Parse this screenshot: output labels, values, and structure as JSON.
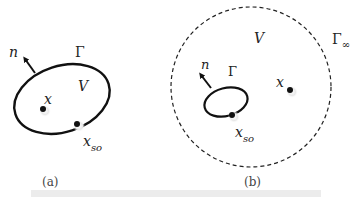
{
  "figure": {
    "panels": [
      {
        "id": "a",
        "caption": "(a)",
        "boundary_label": "Γ",
        "volume_label": "V",
        "normal_label": "n",
        "interior_point_label": "x",
        "source_point_label": "x",
        "source_point_subscript": "so"
      },
      {
        "id": "b",
        "caption": "(b)",
        "boundary_label": "Γ",
        "volume_label": "V",
        "normal_label": "n",
        "exterior_point_label": "x",
        "source_point_label": "x",
        "source_point_subscript": "so",
        "infinity_boundary_label": "Γ",
        "infinity_boundary_subscript": "∞"
      }
    ],
    "colors": {
      "stroke": "#111111",
      "text": "#222222",
      "dot_halo": "#cfcfcf",
      "bottom_bar": "#ececec"
    }
  }
}
